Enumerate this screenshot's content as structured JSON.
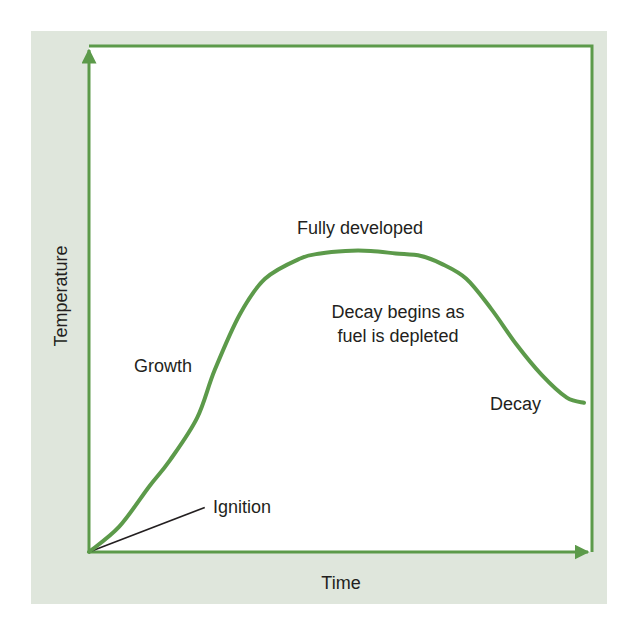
{
  "chart_data": {
    "type": "line",
    "title": "",
    "xlabel": "Time",
    "ylabel": "Temperature",
    "xlim": [
      0,
      100
    ],
    "ylim": [
      0,
      100
    ],
    "grid": false,
    "legend": "none",
    "series": [
      {
        "name": "Fire temperature curve",
        "x": [
          0,
          6,
          12,
          16,
          21.5,
          25,
          30,
          35,
          42,
          46,
          51,
          56,
          61,
          66,
          70,
          75,
          80,
          85,
          90,
          95,
          98.4
        ],
        "y": [
          0,
          5,
          13,
          18,
          26.5,
          36,
          47,
          54,
          58,
          59,
          59.5,
          59.5,
          59,
          58.5,
          57,
          54,
          48,
          41,
          35,
          30.5,
          29.5
        ]
      }
    ],
    "annotations": [
      {
        "text": "Ignition",
        "x": 25,
        "y": 9
      },
      {
        "text": "Growth",
        "x": 12,
        "y": 37
      },
      {
        "text": "Fully developed",
        "x": 42,
        "y": 64
      },
      {
        "text": "Decay begins as",
        "x": 61,
        "y": 47
      },
      {
        "text": "fuel is depleted",
        "x": 61,
        "y": 42
      },
      {
        "text": "Decay",
        "x": 83,
        "y": 29
      }
    ]
  },
  "colors": {
    "panel_background": "#dfe6dc",
    "plot_background": "#ffffff",
    "axis": "#5c9a4a",
    "curve": "#5c9a4a",
    "ignition_leader": "#231f20",
    "text": "#231f20"
  }
}
